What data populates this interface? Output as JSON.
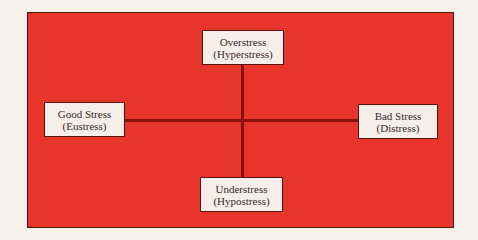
{
  "diagram": {
    "colors": {
      "background": "#e8352c",
      "lines": "#8a1010",
      "box_fill": "#f6eee8"
    },
    "nodes": {
      "top": {
        "line1": "Overstress",
        "line2": "(Hyperstress)"
      },
      "left": {
        "line1": "Good Stress",
        "line2": "(Eustress)"
      },
      "right": {
        "line1": "Bad Stress",
        "line2": "(Distress)"
      },
      "bottom": {
        "line1": "Understress",
        "line2": "(Hypostress)"
      }
    }
  }
}
